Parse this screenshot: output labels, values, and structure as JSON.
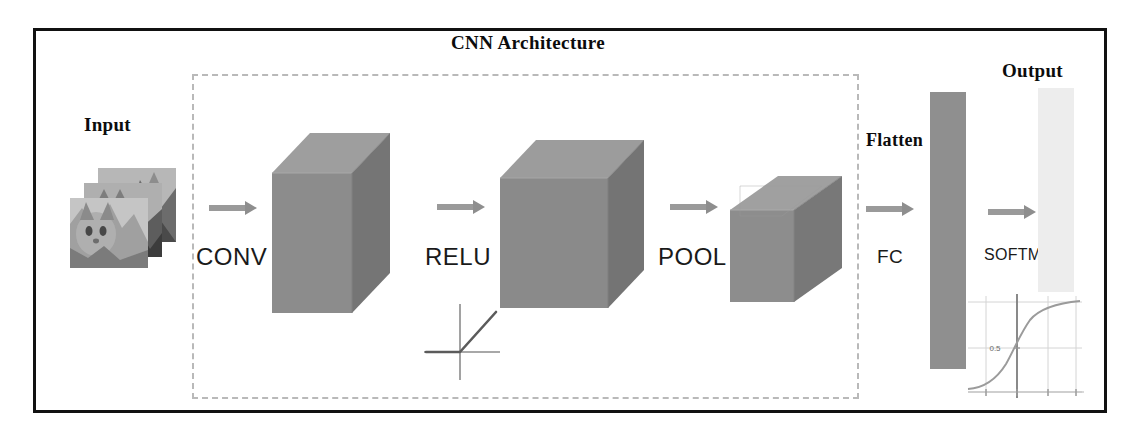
{
  "figure": {
    "title": "CNN Architecture",
    "type": "neural-network-architecture-diagram"
  },
  "labels": {
    "input": "Input",
    "output": "Output",
    "flatten": "Flatten",
    "conv": "CONV",
    "relu": "RELU",
    "pool": "POOL",
    "fc": "FC",
    "softmax": "SOFTMAX"
  },
  "relu_plot": {
    "function": "ReLU",
    "description": "flat at zero for negative x, linear rising for positive x",
    "axes": [
      "x",
      "y"
    ]
  },
  "sigmoid_plot": {
    "function": "sigmoid",
    "description": "S-shaped logistic curve",
    "tick_label": "0.5",
    "grid": true
  },
  "stages": [
    {
      "name": "Input",
      "kind": "image-stack",
      "count": 3
    },
    {
      "name": "CONV",
      "kind": "volume"
    },
    {
      "name": "RELU",
      "kind": "volume"
    },
    {
      "name": "POOL",
      "kind": "volume"
    },
    {
      "name": "Flatten / FC",
      "kind": "column"
    },
    {
      "name": "SOFTMAX / Output",
      "kind": "column"
    }
  ],
  "colors": {
    "frame": "#111111",
    "dashed_border": "#b9b9b9",
    "arrow": "#9a9a9a",
    "cube_front": "#8f8f8f",
    "cube_top": "#a6a6a6",
    "cube_side": "#7a7a7a",
    "flatten_column": "#8f8f8f",
    "output_column": "#ededed",
    "background": "#ffffff"
  }
}
